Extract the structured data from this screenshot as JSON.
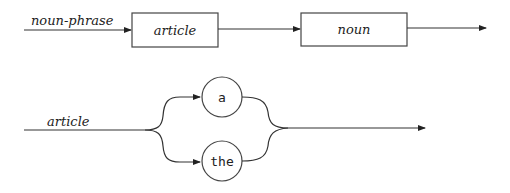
{
  "diagrams": [
    {
      "name": "noun-phrase",
      "rule_label": "noun-phrase",
      "nonterminals": [
        {
          "label": "article"
        },
        {
          "label": "noun"
        }
      ]
    },
    {
      "name": "article",
      "rule_label": "article",
      "terminals": [
        {
          "label": "a"
        },
        {
          "label": "the"
        }
      ]
    }
  ]
}
